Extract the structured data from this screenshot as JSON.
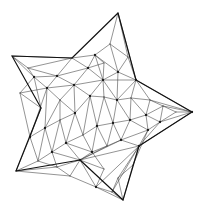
{
  "figure": {
    "background_color": "#ffffff",
    "outline_color": "#111111",
    "mesh_color": "#3a3a3a",
    "vertex_color": "#1a1a1a",
    "width": 213,
    "height": 209
  },
  "chart_data": {
    "type": "diagram",
    "subtype": "triangular-mesh-polygon",
    "xlabel": "",
    "ylabel": "",
    "xlim": [
      0,
      213
    ],
    "ylim": [
      0,
      209
    ],
    "grid": false,
    "legend": false,
    "shape": "5-point star",
    "outline_points": [
      [
        118,
        13
      ],
      [
        136,
        80
      ],
      [
        192,
        112
      ],
      [
        139,
        146
      ],
      [
        123,
        200
      ],
      [
        80,
        160
      ],
      [
        16,
        171
      ],
      [
        41,
        108
      ],
      [
        12,
        56
      ],
      [
        72,
        58
      ]
    ],
    "mesh_nodes": [
      [
        118,
        13
      ],
      [
        136,
        80
      ],
      [
        192,
        112
      ],
      [
        139,
        146
      ],
      [
        123,
        200
      ],
      [
        80,
        160
      ],
      [
        16,
        171
      ],
      [
        41,
        108
      ],
      [
        12,
        56
      ],
      [
        72,
        58
      ],
      [
        95,
        55
      ],
      [
        110,
        44
      ],
      [
        128,
        57
      ],
      [
        118,
        72
      ],
      [
        103,
        80
      ],
      [
        90,
        96
      ],
      [
        104,
        97
      ],
      [
        117,
        100
      ],
      [
        131,
        98
      ],
      [
        150,
        100
      ],
      [
        163,
        106
      ],
      [
        176,
        112
      ],
      [
        160,
        122
      ],
      [
        146,
        115
      ],
      [
        130,
        120
      ],
      [
        113,
        123
      ],
      [
        97,
        126
      ],
      [
        83,
        135
      ],
      [
        66,
        143
      ],
      [
        52,
        152
      ],
      [
        38,
        161
      ],
      [
        30,
        137
      ],
      [
        45,
        128
      ],
      [
        60,
        120
      ],
      [
        75,
        113
      ],
      [
        60,
        100
      ],
      [
        47,
        88
      ],
      [
        34,
        77
      ],
      [
        57,
        76
      ],
      [
        74,
        85
      ],
      [
        88,
        68
      ],
      [
        104,
        63
      ],
      [
        148,
        130
      ],
      [
        133,
        165
      ],
      [
        118,
        178
      ],
      [
        104,
        169
      ],
      [
        92,
        152
      ],
      [
        107,
        146
      ],
      [
        121,
        140
      ],
      [
        28,
        68
      ],
      [
        20,
        93
      ],
      [
        57,
        167
      ],
      [
        70,
        176
      ],
      [
        96,
        187
      ],
      [
        112,
        192
      ]
    ],
    "triangles": [
      [
        0,
        11,
        12
      ],
      [
        11,
        10,
        13
      ],
      [
        0,
        12,
        1
      ],
      [
        12,
        13,
        1
      ],
      [
        13,
        14,
        1
      ],
      [
        10,
        11,
        13
      ],
      [
        10,
        13,
        14
      ],
      [
        9,
        10,
        40
      ],
      [
        40,
        10,
        41
      ],
      [
        41,
        10,
        14
      ],
      [
        9,
        40,
        38
      ],
      [
        38,
        40,
        39
      ],
      [
        39,
        40,
        14
      ],
      [
        8,
        9,
        49
      ],
      [
        49,
        9,
        38
      ],
      [
        49,
        38,
        37
      ],
      [
        8,
        49,
        37
      ],
      [
        37,
        38,
        36
      ],
      [
        38,
        39,
        36
      ],
      [
        36,
        39,
        35
      ],
      [
        7,
        37,
        50
      ],
      [
        50,
        37,
        36
      ],
      [
        7,
        50,
        31
      ],
      [
        31,
        50,
        36
      ],
      [
        31,
        36,
        32
      ],
      [
        32,
        36,
        35
      ],
      [
        32,
        35,
        33
      ],
      [
        33,
        35,
        34
      ],
      [
        35,
        39,
        34
      ],
      [
        34,
        39,
        15
      ],
      [
        39,
        14,
        15
      ],
      [
        14,
        16,
        15
      ],
      [
        14,
        13,
        17
      ],
      [
        13,
        1,
        17
      ],
      [
        17,
        1,
        18
      ],
      [
        1,
        19,
        18
      ],
      [
        1,
        2,
        19
      ],
      [
        19,
        2,
        20
      ],
      [
        20,
        2,
        21
      ],
      [
        21,
        2,
        22
      ],
      [
        22,
        2,
        3
      ],
      [
        20,
        21,
        22
      ],
      [
        19,
        20,
        23
      ],
      [
        20,
        22,
        23
      ],
      [
        23,
        22,
        42
      ],
      [
        42,
        22,
        3
      ],
      [
        18,
        19,
        23
      ],
      [
        18,
        23,
        24
      ],
      [
        24,
        23,
        42
      ],
      [
        24,
        42,
        48
      ],
      [
        42,
        3,
        48
      ],
      [
        17,
        18,
        24
      ],
      [
        17,
        24,
        25
      ],
      [
        25,
        24,
        48
      ],
      [
        25,
        48,
        47
      ],
      [
        16,
        17,
        25
      ],
      [
        16,
        25,
        26
      ],
      [
        26,
        25,
        47
      ],
      [
        26,
        47,
        46
      ],
      [
        15,
        16,
        26
      ],
      [
        15,
        26,
        27
      ],
      [
        27,
        26,
        46
      ],
      [
        34,
        15,
        27
      ],
      [
        34,
        27,
        28
      ],
      [
        33,
        34,
        28
      ],
      [
        33,
        28,
        29
      ],
      [
        32,
        33,
        29
      ],
      [
        32,
        29,
        30
      ],
      [
        31,
        32,
        30
      ],
      [
        6,
        31,
        30
      ],
      [
        28,
        27,
        46
      ],
      [
        28,
        46,
        5
      ],
      [
        29,
        28,
        5
      ],
      [
        29,
        5,
        51
      ],
      [
        30,
        29,
        51
      ],
      [
        6,
        30,
        51
      ],
      [
        6,
        51,
        52
      ],
      [
        51,
        5,
        52
      ],
      [
        5,
        46,
        47
      ],
      [
        5,
        47,
        48
      ],
      [
        5,
        48,
        3
      ],
      [
        52,
        5,
        53
      ],
      [
        53,
        5,
        3
      ],
      [
        53,
        3,
        54
      ],
      [
        54,
        3,
        44
      ],
      [
        3,
        43,
        44
      ],
      [
        3,
        42,
        43
      ],
      [
        43,
        3,
        44
      ],
      [
        54,
        44,
        4
      ],
      [
        53,
        54,
        4
      ],
      [
        44,
        43,
        4
      ],
      [
        43,
        44,
        4
      ],
      [
        45,
        46,
        5
      ],
      [
        5,
        45,
        53
      ]
    ],
    "counts": {
      "outline_vertices": 10,
      "mesh_nodes": 55,
      "triangles": 95
    }
  }
}
